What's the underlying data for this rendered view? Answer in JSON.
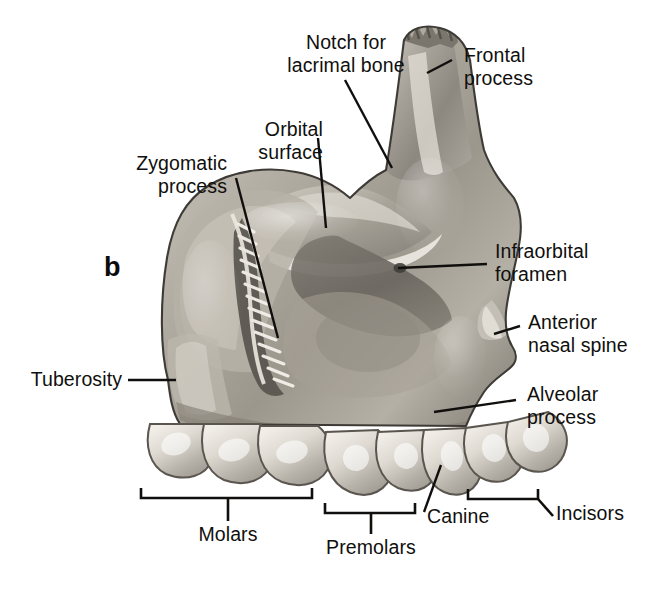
{
  "figure": {
    "panel_letter": "b",
    "background_color": "#ffffff",
    "ink_color": "#100f0d",
    "bone_tone_light": "#d8d4cc",
    "bone_tone_mid": "#a9a49a",
    "bone_tone_dark": "#6e6a62",
    "tooth_tone": "#e9e6df"
  },
  "labels": {
    "notch_for_lacrimal_bone": "Notch for\nlacrimal bone",
    "frontal_process": "Frontal\nprocess",
    "orbital_surface": "Orbital\nsurface",
    "zygomatic_process": "Zygomatic\nprocess",
    "infraorbital_foramen": "Infraorbital\nforamen",
    "anterior_nasal_spine": "Anterior\nnasal spine",
    "alveolar_process": "Alveolar\nprocess",
    "tuberosity": "Tuberosity",
    "molars": "Molars",
    "premolars": "Premolars",
    "canine": "Canine",
    "incisors": "Incisors"
  },
  "tooth_groups": [
    {
      "name": "molars",
      "label": "Molars",
      "bracket": true
    },
    {
      "name": "premolars",
      "label": "Premolars",
      "bracket": true
    },
    {
      "name": "canine",
      "label": "Canine",
      "bracket": false
    },
    {
      "name": "incisors",
      "label": "Incisors",
      "bracket": true
    }
  ]
}
